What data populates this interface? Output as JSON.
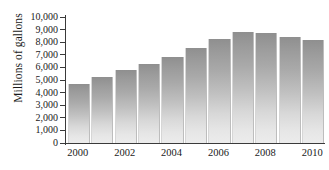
{
  "chart_data": {
    "type": "bar",
    "title": "",
    "xlabel": "",
    "ylabel": "Millions of gallons",
    "categories": [
      "2000",
      "2001",
      "2002",
      "2003",
      "2004",
      "2005",
      "2006",
      "2007",
      "2008",
      "2009",
      "2010"
    ],
    "values": [
      4700,
      5200,
      5800,
      6250,
      6800,
      7550,
      8250,
      8800,
      8700,
      8450,
      8200
    ],
    "ylim": [
      0,
      10000
    ],
    "ytick_labels": [
      "10,000",
      "9,000",
      "8,000",
      "7,000",
      "6,000",
      "5,000",
      "4,000",
      "3,000",
      "2,000",
      "1,000",
      "0"
    ],
    "ytick_values": [
      10000,
      9000,
      8000,
      7000,
      6000,
      5000,
      4000,
      3000,
      2000,
      1000,
      0
    ],
    "xtick_labels": [
      "2000",
      "2002",
      "2004",
      "2006",
      "2008",
      "2010"
    ],
    "xtick_categories": [
      "2000",
      "2002",
      "2004",
      "2006",
      "2008",
      "2010"
    ],
    "grid": false,
    "legend": null,
    "bar_color_top": "#8f8f8f",
    "bar_color_bottom": "#ececec",
    "axis_color": "#3a3a3a",
    "background": "#ffffff"
  }
}
